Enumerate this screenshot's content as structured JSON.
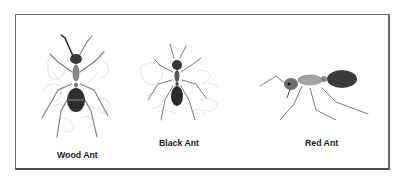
{
  "figure": {
    "specimens": [
      {
        "name": "wood-ant",
        "label": "Wood Ant"
      },
      {
        "name": "black-ant",
        "label": "Black Ant"
      },
      {
        "name": "red-ant",
        "label": "Red Ant"
      }
    ]
  },
  "colors": {
    "border": "#6a6a6a",
    "ant_dark": "#2b2b2b",
    "ant_body": "#8a8a8a",
    "sketch": "#d2d2d2",
    "label": "#1a1a1a"
  }
}
